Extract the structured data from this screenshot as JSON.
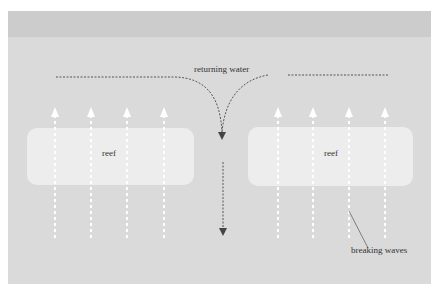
{
  "diagram": {
    "labels": {
      "returning_water": "returning water",
      "reef_left": "reef",
      "reef_right": "reef",
      "breaking_waves": "breaking waves"
    },
    "colors": {
      "background": "#dadada",
      "top_band": "#cccccc",
      "reef": "#ededed",
      "wave_lines": "#ffffff",
      "current_lines": "#555555"
    },
    "icons": {
      "wave_arrow": "up-arrow",
      "current_arrow": "down-arrow"
    }
  }
}
